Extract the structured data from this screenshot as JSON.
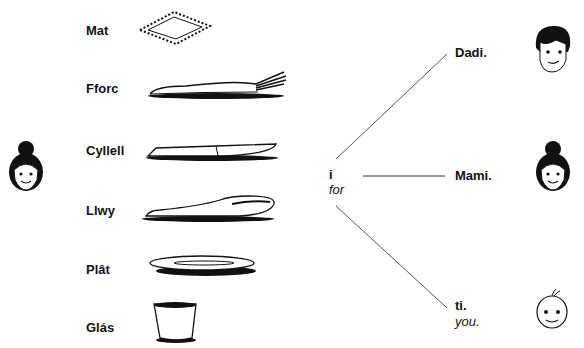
{
  "items": [
    {
      "welsh": "Mat",
      "icon": "place-mat-icon"
    },
    {
      "welsh": "Fforc",
      "icon": "fork-icon"
    },
    {
      "welsh": "Cyllell",
      "icon": "knife-icon"
    },
    {
      "welsh": "Llwy",
      "icon": "spoon-icon"
    },
    {
      "welsh": "Plât",
      "icon": "plate-icon"
    },
    {
      "welsh": "Glás",
      "icon": "glass-icon"
    }
  ],
  "preposition": {
    "welsh": "i",
    "english": "for"
  },
  "targets": [
    {
      "welsh": "Dadi.",
      "english": "",
      "icon": "father-face-icon"
    },
    {
      "welsh": "Mami.",
      "english": "",
      "icon": "mother-face-icon"
    },
    {
      "welsh": "ti.",
      "english": "you.",
      "icon": "baby-face-icon"
    }
  ],
  "speaker": {
    "icon": "mother-face-icon"
  }
}
